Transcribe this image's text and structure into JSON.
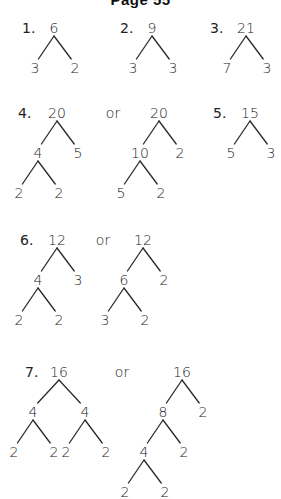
{
  "title": "Page 55",
  "or_label": "or",
  "problems": [
    {
      "number": "1.",
      "trees": [
        {
          "root": "6",
          "children": [
            {
              "value": "3"
            },
            {
              "value": "2"
            }
          ]
        }
      ]
    },
    {
      "number": "2.",
      "trees": [
        {
          "root": "9",
          "children": [
            {
              "value": "3"
            },
            {
              "value": "3"
            }
          ]
        }
      ]
    },
    {
      "number": "3.",
      "trees": [
        {
          "root": "21",
          "children": [
            {
              "value": "7"
            },
            {
              "value": "3"
            }
          ]
        }
      ]
    },
    {
      "number": "4.",
      "trees": [
        {
          "root": "20",
          "children": [
            {
              "value": "4",
              "children": [
                {
                  "value": "2"
                },
                {
                  "value": "2"
                }
              ]
            },
            {
              "value": "5"
            }
          ]
        },
        {
          "root": "20",
          "children": [
            {
              "value": "10",
              "children": [
                {
                  "value": "5"
                },
                {
                  "value": "2"
                }
              ]
            },
            {
              "value": "2"
            }
          ]
        }
      ]
    },
    {
      "number": "5.",
      "trees": [
        {
          "root": "15",
          "children": [
            {
              "value": "5"
            },
            {
              "value": "3"
            }
          ]
        }
      ]
    },
    {
      "number": "6.",
      "trees": [
        {
          "root": "12",
          "children": [
            {
              "value": "4",
              "children": [
                {
                  "value": "2"
                },
                {
                  "value": "2"
                }
              ]
            },
            {
              "value": "3"
            }
          ]
        },
        {
          "root": "12",
          "children": [
            {
              "value": "6",
              "children": [
                {
                  "value": "3"
                },
                {
                  "value": "2"
                }
              ]
            },
            {
              "value": "2"
            }
          ]
        }
      ]
    },
    {
      "number": "7.",
      "trees": [
        {
          "root": "16",
          "children": [
            {
              "value": "4",
              "children": [
                {
                  "value": "2"
                },
                {
                  "value": "2"
                }
              ]
            },
            {
              "value": "4",
              "children": [
                {
                  "value": "2"
                },
                {
                  "value": "2"
                }
              ]
            }
          ]
        },
        {
          "root": "16",
          "children": [
            {
              "value": "8",
              "children": [
                {
                  "value": "4",
                  "children": [
                    {
                      "value": "2"
                    },
                    {
                      "value": "2"
                    }
                  ]
                },
                {
                  "value": "2"
                }
              ]
            },
            {
              "value": "2"
            }
          ]
        }
      ]
    }
  ]
}
